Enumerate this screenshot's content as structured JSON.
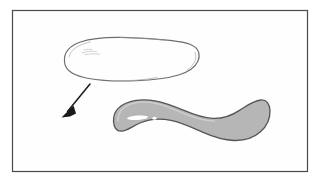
{
  "figure": {
    "name": "two-shape-transformation-figure",
    "background_color": "#ffffff",
    "frame": {
      "name": "figure-border",
      "x": 12,
      "y": 10,
      "width": 296,
      "height": 162,
      "stroke_color": "#4a4a4a",
      "stroke_width": 1.2,
      "fill_color": "#fefefe"
    },
    "shapes": [
      {
        "name": "outline-shape-upper",
        "type": "closed-freehand-outline",
        "filled": false,
        "fill_color": "none",
        "stroke_color": "#6e6e6e",
        "stroke_width": 1.1,
        "bounds": {
          "x": 64,
          "y": 36,
          "width": 136,
          "height": 46
        },
        "interior_mark": {
          "name": "faint-interior-scribble",
          "x": 82,
          "y": 51,
          "width": 19,
          "height": 4,
          "color": "#c9c9c9"
        }
      },
      {
        "name": "shaded-shape-lower",
        "type": "closed-freehand-filled",
        "filled": true,
        "fill_color": "#b6b6b6",
        "stroke_color": "#555555",
        "stroke_width": 1.3,
        "bounds": {
          "x": 113,
          "y": 99,
          "width": 157,
          "height": 42
        },
        "highlight": {
          "name": "white-highlight-streak",
          "color": "#ffffff",
          "streak": {
            "x": 127,
            "y": 116,
            "width": 21,
            "height": 4
          },
          "dot": {
            "x": 153,
            "y": 117,
            "width": 4,
            "height": 3
          }
        }
      }
    ],
    "arrow": {
      "name": "transformation-arrow",
      "color": "#1a1a1a",
      "stroke_width": 1.4,
      "tail_x": 90,
      "tail_y": 84,
      "head_x": 62,
      "head_y": 117,
      "head_length": 11,
      "head_width": 8,
      "direction": "down-left"
    }
  }
}
